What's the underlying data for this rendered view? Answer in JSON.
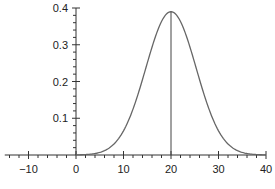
{
  "chart_data": {
    "type": "line",
    "title": "",
    "xlabel": "",
    "ylabel": "",
    "xlim": [
      -15,
      40
    ],
    "ylim": [
      0,
      0.4
    ],
    "grid": false,
    "legend": null,
    "x_ticks": [
      -10,
      0,
      10,
      20,
      30,
      40
    ],
    "x_tick_labels": [
      "−10",
      "0",
      "10",
      "20",
      "30",
      "40"
    ],
    "y_ticks": [
      0.1,
      0.2,
      0.3,
      0.4
    ],
    "y_tick_labels": [
      "0.1",
      "0.2",
      "0.3",
      "0.4"
    ],
    "series": [
      {
        "name": "normal density curve",
        "mean": 20,
        "peak": 0.39,
        "x": [
          0,
          4,
          6,
          8,
          10,
          12,
          14,
          16,
          18,
          20,
          22,
          24,
          26,
          28,
          30,
          32,
          34,
          36,
          38,
          40
        ],
        "y": [
          0.0,
          0.002,
          0.006,
          0.016,
          0.037,
          0.075,
          0.135,
          0.215,
          0.3,
          0.39,
          0.3,
          0.215,
          0.135,
          0.075,
          0.037,
          0.016,
          0.006,
          0.002,
          0.0005,
          0.0
        ]
      }
    ],
    "annotations": [
      {
        "type": "vertical-line",
        "x": 20,
        "from_y": 0,
        "to_y": 0.39,
        "label": "mean"
      }
    ],
    "color": "#555555"
  }
}
